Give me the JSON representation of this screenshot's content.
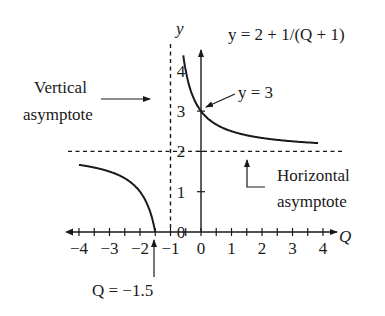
{
  "chart_data": {
    "type": "line",
    "title": "y = 2 + 1/(Q + 1)",
    "function": "y = 2 + 1/(Q + 1)",
    "xlabel": "Q",
    "ylabel": "y",
    "xlim": [
      -4,
      4
    ],
    "ylim": [
      0,
      4
    ],
    "x_ticks": [
      -4,
      -3,
      -2,
      -1,
      0,
      1,
      2,
      3,
      4
    ],
    "x_tick_labels": [
      "−4",
      "−3",
      "−2",
      "−1",
      "0",
      "1",
      "2",
      "3",
      "4"
    ],
    "x_minor_tick_step": 0.5,
    "y_ticks": [
      0,
      1,
      2,
      3,
      4
    ],
    "y_tick_labels": [
      "0",
      "1",
      "2",
      "3",
      "4"
    ],
    "grid": false,
    "series": [
      {
        "name": "right branch",
        "x": [
          -0.75,
          -0.5,
          -0.25,
          0,
          0.5,
          1,
          2,
          3,
          4
        ],
        "y": [
          6.0,
          4.0,
          3.33,
          3.0,
          2.67,
          2.5,
          2.33,
          2.25,
          2.2
        ]
      },
      {
        "name": "left branch",
        "x": [
          -4,
          -3,
          -2.5,
          -2,
          -1.5
        ],
        "y": [
          1.67,
          1.5,
          1.33,
          1.0,
          0.0
        ]
      }
    ],
    "asymptotes": {
      "vertical": {
        "Q": -1,
        "style": "dashed"
      },
      "horizontal": {
        "y": 2,
        "style": "dashed"
      }
    },
    "annotations": [
      {
        "text": "Vertical asymptote",
        "line1": "Vertical",
        "line2": "asymptote",
        "points_to": "Q = -1"
      },
      {
        "text": "Horizontal asymptote",
        "line1": "Horizontal",
        "line2": "asymptote",
        "points_to": "y = 2"
      },
      {
        "text": "y = 3",
        "points_to": [
          0,
          3
        ]
      },
      {
        "text": "Q = −1.5",
        "points_to": [
          -1.5,
          0
        ]
      }
    ]
  },
  "labels": {
    "equation": "y = 2 + 1/(Q + 1)",
    "y_axis": "y",
    "x_axis": "Q",
    "vertical_line1": "Vertical",
    "vertical_line2": "asymptote",
    "horizontal_line1": "Horizontal",
    "horizontal_line2": "asymptote",
    "y_intercept": "y = 3",
    "x_intercept": "Q = −1.5"
  },
  "colors": {
    "ink": "#1a1a1a",
    "background": "#ffffff"
  }
}
